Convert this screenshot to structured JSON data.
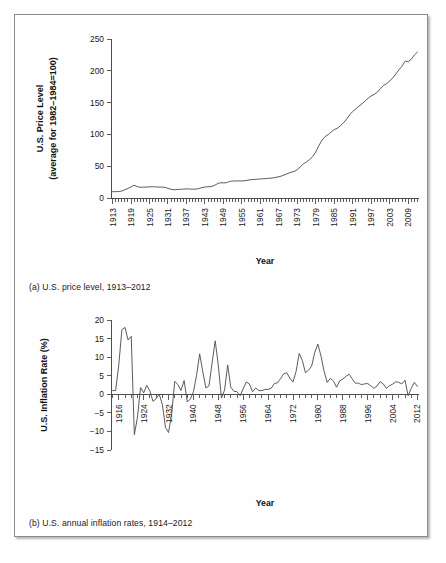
{
  "figure": {
    "caption_a": "(a) U.S. price level, 1913–2012",
    "caption_b": "(b) U.S. annual inflation rates, 1914–2012",
    "border_color": "#8c8c8c",
    "line_color": "#4a4a4a"
  },
  "chart_data": [
    {
      "id": "price-level",
      "type": "line",
      "title": "",
      "xlabel": "Year",
      "ylabel": "U.S. Price Level (average for 1982–1984=100)",
      "ylabel_line1": "U.S. Price Level",
      "ylabel_line2": "(average for 1982–1984=100)",
      "ylim": [
        0,
        250
      ],
      "yticks": [
        0,
        50,
        100,
        150,
        200,
        250
      ],
      "ytick_labels": [
        "0",
        "50",
        "100",
        "150",
        "200",
        "250"
      ],
      "xlim": [
        1913,
        2012
      ],
      "xticks": [
        1913,
        1919,
        1925,
        1931,
        1937,
        1943,
        1949,
        1955,
        1961,
        1967,
        1973,
        1979,
        1985,
        1991,
        1997,
        2003,
        2009
      ],
      "xtick_labels": [
        "1913",
        "1919",
        "1925",
        "1931",
        "1937",
        "1943",
        "1949",
        "1955",
        "1961",
        "1967",
        "1973",
        "1979",
        "1985",
        "1991",
        "1997",
        "2003",
        "2009"
      ],
      "minor_tick_step": 1,
      "grid": false,
      "legend": null,
      "x": [
        1913,
        1914,
        1915,
        1916,
        1917,
        1918,
        1919,
        1920,
        1921,
        1922,
        1923,
        1924,
        1925,
        1926,
        1927,
        1928,
        1929,
        1930,
        1931,
        1932,
        1933,
        1934,
        1935,
        1936,
        1937,
        1938,
        1939,
        1940,
        1941,
        1942,
        1943,
        1944,
        1945,
        1946,
        1947,
        1948,
        1949,
        1950,
        1951,
        1952,
        1953,
        1954,
        1955,
        1956,
        1957,
        1958,
        1959,
        1960,
        1961,
        1962,
        1963,
        1964,
        1965,
        1966,
        1967,
        1968,
        1969,
        1970,
        1971,
        1972,
        1973,
        1974,
        1975,
        1976,
        1977,
        1978,
        1979,
        1980,
        1981,
        1982,
        1983,
        1984,
        1985,
        1986,
        1987,
        1988,
        1989,
        1990,
        1991,
        1992,
        1993,
        1994,
        1995,
        1996,
        1997,
        1998,
        1999,
        2000,
        2001,
        2002,
        2003,
        2004,
        2005,
        2006,
        2007,
        2008,
        2009,
        2010,
        2011,
        2012
      ],
      "values": [
        9.9,
        10.0,
        10.1,
        11.0,
        12.9,
        15.2,
        17.4,
        20.1,
        17.9,
        16.8,
        17.1,
        17.1,
        17.6,
        17.7,
        17.4,
        17.2,
        17.2,
        16.7,
        15.2,
        13.6,
        12.9,
        13.4,
        13.7,
        13.9,
        14.4,
        14.1,
        13.9,
        14.0,
        14.7,
        16.3,
        17.3,
        17.6,
        18.0,
        19.5,
        22.3,
        24.0,
        23.8,
        24.1,
        26.0,
        26.6,
        26.8,
        26.9,
        26.8,
        27.2,
        28.1,
        28.9,
        29.2,
        29.6,
        29.9,
        30.3,
        30.6,
        31.0,
        31.5,
        32.5,
        33.4,
        34.8,
        36.7,
        38.8,
        40.5,
        41.8,
        44.4,
        49.3,
        53.8,
        56.9,
        60.6,
        65.2,
        72.6,
        82.4,
        90.9,
        96.5,
        99.6,
        103.9,
        107.6,
        109.6,
        113.6,
        118.3,
        124.0,
        130.7,
        136.2,
        140.3,
        144.5,
        148.2,
        152.4,
        156.9,
        160.5,
        163.0,
        166.6,
        172.2,
        177.1,
        179.9,
        184.0,
        188.9,
        195.3,
        201.6,
        207.3,
        215.3,
        214.5,
        218.1,
        224.9,
        229.6
      ]
    },
    {
      "id": "inflation-rate",
      "type": "line",
      "title": "",
      "xlabel": "Year",
      "ylabel": "U.S. Inflation Rate (%)",
      "ylim": [
        -15,
        20
      ],
      "yticks": [
        -15,
        -10,
        -5,
        0,
        5,
        10,
        15,
        20
      ],
      "ytick_labels": [
        "−15",
        "−10",
        "−5",
        "0",
        "5",
        "10",
        "15",
        "20"
      ],
      "xlim": [
        1914,
        2012
      ],
      "xticks": [
        1916,
        1924,
        1932,
        1940,
        1948,
        1956,
        1964,
        1972,
        1980,
        1988,
        1996,
        2004,
        2012
      ],
      "xtick_labels": [
        "1916",
        "1924",
        "1932",
        "1940",
        "1948",
        "1956",
        "1964",
        "1972",
        "1980",
        "1988",
        "1996",
        "2004",
        "2012"
      ],
      "minor_tick_step": 2,
      "grid": false,
      "legend": null,
      "zero_line": 0,
      "x": [
        1914,
        1915,
        1916,
        1917,
        1918,
        1919,
        1920,
        1921,
        1922,
        1923,
        1924,
        1925,
        1926,
        1927,
        1928,
        1929,
        1930,
        1931,
        1932,
        1933,
        1934,
        1935,
        1936,
        1937,
        1938,
        1939,
        1940,
        1941,
        1942,
        1943,
        1944,
        1945,
        1946,
        1947,
        1948,
        1949,
        1950,
        1951,
        1952,
        1953,
        1954,
        1955,
        1956,
        1957,
        1958,
        1959,
        1960,
        1961,
        1962,
        1963,
        1964,
        1965,
        1966,
        1967,
        1968,
        1969,
        1970,
        1971,
        1972,
        1973,
        1974,
        1975,
        1976,
        1977,
        1978,
        1979,
        1980,
        1981,
        1982,
        1983,
        1984,
        1985,
        1986,
        1987,
        1988,
        1989,
        1990,
        1991,
        1992,
        1993,
        1994,
        1995,
        1996,
        1997,
        1998,
        1999,
        2000,
        2001,
        2002,
        2003,
        2004,
        2005,
        2006,
        2007,
        2008,
        2009,
        2010,
        2011,
        2012
      ],
      "values": [
        1.0,
        1.0,
        7.9,
        17.4,
        18.0,
        14.6,
        15.6,
        -10.9,
        -6.2,
        1.8,
        0.4,
        2.4,
        0.9,
        -1.9,
        -1.2,
        0.0,
        -2.7,
        -8.9,
        -10.3,
        -5.2,
        3.5,
        2.6,
        1.0,
        3.7,
        -2.0,
        -1.3,
        0.7,
        5.1,
        10.9,
        6.1,
        1.7,
        2.3,
        8.5,
        14.4,
        7.7,
        -1.0,
        1.1,
        7.9,
        1.9,
        0.8,
        0.7,
        -0.4,
        1.5,
        3.3,
        2.8,
        0.7,
        1.7,
        1.0,
        1.0,
        1.3,
        1.3,
        1.6,
        2.9,
        3.1,
        4.2,
        5.5,
        5.8,
        4.3,
        3.3,
        6.2,
        11.0,
        9.1,
        5.8,
        6.5,
        7.6,
        11.3,
        13.5,
        10.3,
        6.2,
        3.2,
        4.3,
        3.6,
        1.9,
        3.6,
        4.1,
        4.8,
        5.4,
        4.2,
        3.0,
        3.0,
        2.6,
        2.8,
        2.9,
        2.3,
        1.6,
        2.2,
        3.4,
        2.8,
        1.6,
        2.3,
        2.7,
        3.4,
        3.2,
        2.8,
        3.8,
        -0.4,
        1.6,
        3.2,
        2.1
      ]
    }
  ]
}
